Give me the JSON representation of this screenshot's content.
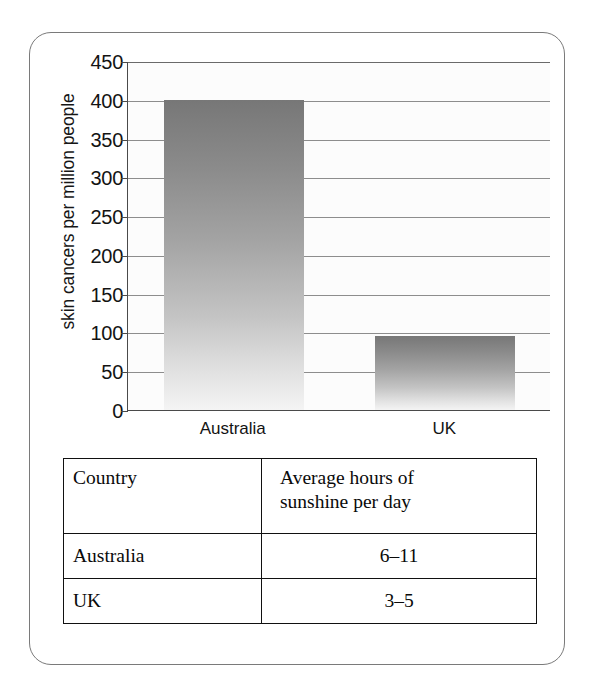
{
  "chart_data": {
    "type": "bar",
    "title": "",
    "xlabel": "",
    "ylabel": "skin cancers per million people",
    "categories": [
      "Australia",
      "UK"
    ],
    "values": [
      400,
      95
    ],
    "ylim": [
      0,
      450
    ],
    "yticks": [
      0,
      50,
      100,
      150,
      200,
      250,
      300,
      350,
      400,
      450
    ],
    "ytick_labels": [
      "0",
      "50",
      "100",
      "150",
      "200",
      "250",
      "300",
      "350",
      "400",
      "450"
    ],
    "grid": true,
    "legend": "none",
    "bar_fill": "#8b8b8b",
    "axis_color": "#4a4a4a",
    "grid_color": "#8d8d8d"
  },
  "table": {
    "header": {
      "country": "Country",
      "sunshine_line1": "Average hours of",
      "sunshine_line2": "sunshine per day"
    },
    "rows": [
      {
        "country": "Australia",
        "sunshine": "6–11"
      },
      {
        "country": "UK",
        "sunshine": "3–5"
      }
    ]
  },
  "frame": {
    "border_color": "#7a7a7a"
  }
}
